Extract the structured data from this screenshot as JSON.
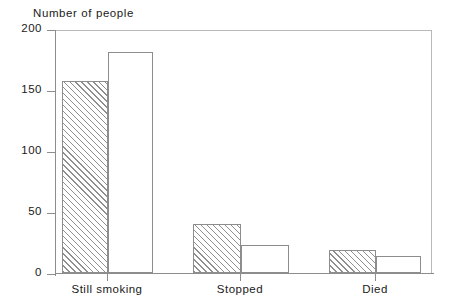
{
  "chart_data": {
    "type": "bar",
    "title": "Number of people",
    "xlabel": "",
    "ylabel": "Number of people",
    "ylim": [
      0,
      200
    ],
    "yticks": [
      0,
      50,
      100,
      150,
      200
    ],
    "ytick_labels": [
      "0",
      "50",
      "100",
      "150",
      "200"
    ],
    "grid": false,
    "legend": "none",
    "categories": [
      "Still smoking",
      "Stopped",
      "Died"
    ],
    "series": [
      {
        "name": "series-1",
        "style": "hatched",
        "values": [
          157,
          40,
          19
        ]
      },
      {
        "name": "series-2",
        "style": "open",
        "values": [
          181,
          23,
          14
        ]
      }
    ]
  },
  "axis": {
    "y_label_0": "0",
    "y_label_1": "50",
    "y_label_2": "100",
    "y_label_3": "150",
    "y_label_4": "200",
    "x_label_0": "Still smoking",
    "x_label_1": "Stopped",
    "x_label_2": "Died"
  },
  "colors": {
    "axis": "#8d8d8d",
    "frame": "#b9b9b9",
    "hatch": "#8f8f8f",
    "text": "#1a1a1a",
    "background": "#ffffff"
  }
}
